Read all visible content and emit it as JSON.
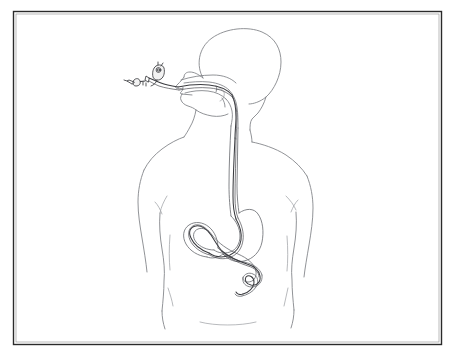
{
  "illustration": {
    "title": "Upper gastrointestinal endoscopy placement diagram",
    "subject": "Human torso, posterior view, with endoscope inserted via the mouth",
    "style": "monochrome line drawing",
    "background_color": "#ffffff",
    "frame": {
      "name": "outer-frame",
      "stroke_color": "#2a2a2a",
      "inset_px": 18
    },
    "palette": {
      "body_outline": "#7d7f84",
      "body_detail": "#9a9ca1",
      "organ_outline": "#6e7075",
      "scope_tube": "#3b3c40",
      "handle": "#3a3b3f",
      "background": "#ffffff"
    },
    "parts": [
      {
        "id": "frame",
        "label": "Picture frame border"
      },
      {
        "id": "head",
        "label": "Head and skull profile"
      },
      {
        "id": "face",
        "label": "Face profile with nose, lips and chin"
      },
      {
        "id": "neck",
        "label": "Neck"
      },
      {
        "id": "shoulders",
        "label": "Shoulders and upper back"
      },
      {
        "id": "arms",
        "label": "Left and right arms"
      },
      {
        "id": "torso",
        "label": "Back and waist outline"
      },
      {
        "id": "hips",
        "label": "Hips and buttocks"
      },
      {
        "id": "oral-cavity",
        "label": "Oral cavity and tongue"
      },
      {
        "id": "pharynx",
        "label": "Pharynx and airway"
      },
      {
        "id": "esophagus",
        "label": "Esophagus"
      },
      {
        "id": "stomach",
        "label": "Stomach"
      },
      {
        "id": "duodenum",
        "label": "Duodenum and small bowel loop"
      },
      {
        "id": "endoscope-tube",
        "label": "Flexible endoscope insertion tube"
      },
      {
        "id": "endoscope-handle",
        "label": "Endoscope control handle"
      },
      {
        "id": "endoscope-connector",
        "label": "Endoscope light-guide connector"
      }
    ],
    "captions": []
  }
}
